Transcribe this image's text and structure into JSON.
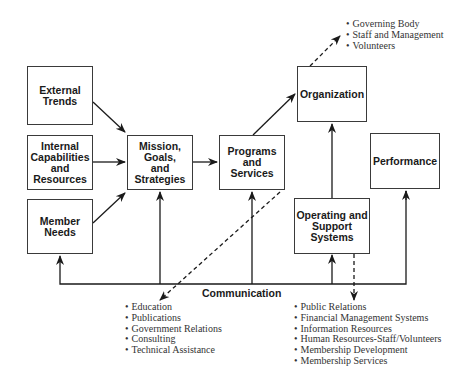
{
  "diagram": {
    "boxes": {
      "external_trends": "External\nTrends",
      "internal_capabilities": "Internal\nCapabilities\nand\nResources",
      "member_needs": "Member\nNeeds",
      "mission": "Mission,\nGoals,\nand\nStrategies",
      "programs": "Programs\nand\nServices",
      "organization": "Organization",
      "performance": "Performance",
      "operating": "Operating and\nSupport\nSystems"
    },
    "communication_label": "Communication",
    "organization_items": [
      "Governing Body",
      "Staff and Management",
      "Volunteers"
    ],
    "programs_items": [
      "Education",
      "Publications",
      "Government Relations",
      "Consulting",
      "Technical Assistance"
    ],
    "operating_items": [
      "Public Relations",
      "Financial Management Systems",
      "Information Resources",
      "Human Resources-Staff/Volunteers",
      "Membership Development",
      "Membership Services"
    ],
    "colors": {
      "line": "#1a1a1a",
      "text": "#1a1a1a",
      "bullet_text": "#333333"
    }
  }
}
